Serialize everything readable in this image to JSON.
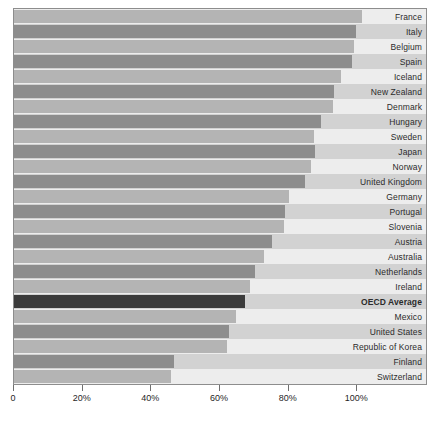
{
  "chart_data": {
    "type": "bar",
    "orientation": "horizontal",
    "title": "",
    "xlabel": "",
    "ylabel": "",
    "xlim": [
      0,
      120
    ],
    "xticks": [
      0,
      20,
      40,
      60,
      80,
      100
    ],
    "xtick_labels": [
      "0",
      "20%",
      "40%",
      "60%",
      "80%",
      "100%"
    ],
    "grid": true,
    "legend": "none",
    "categories": [
      "France",
      "Italy",
      "Belgium",
      "Spain",
      "Iceland",
      "New Zealand",
      "Denmark",
      "Hungary",
      "Sweden",
      "Japan",
      "Norway",
      "United Kingdom",
      "Germany",
      "Portugal",
      "Slovenia",
      "Austria",
      "Australia",
      "Netherlands",
      "Ireland",
      "OECD Average",
      "Mexico",
      "United States",
      "Republic of Korea",
      "Finland",
      "Switzerland"
    ],
    "values": [
      101.5,
      99.7,
      99.1,
      98.5,
      95.1,
      93.3,
      93.0,
      89.5,
      87.5,
      87.8,
      86.6,
      84.9,
      80.0,
      78.8,
      78.5,
      75.0,
      72.7,
      70.3,
      68.6,
      67.2,
      64.8,
      62.5,
      61.9,
      46.5,
      45.6
    ],
    "accent_category": "OECD Average",
    "colors": {
      "bar_light": "#b4b4b4",
      "bar_dark": "#8d8d8d",
      "bar_accent": "#3b3b3b",
      "band_light": "#ededed",
      "band_dark": "#d2d2d2",
      "frame": "#8d8d8d",
      "text": "#2b2b2b"
    }
  }
}
